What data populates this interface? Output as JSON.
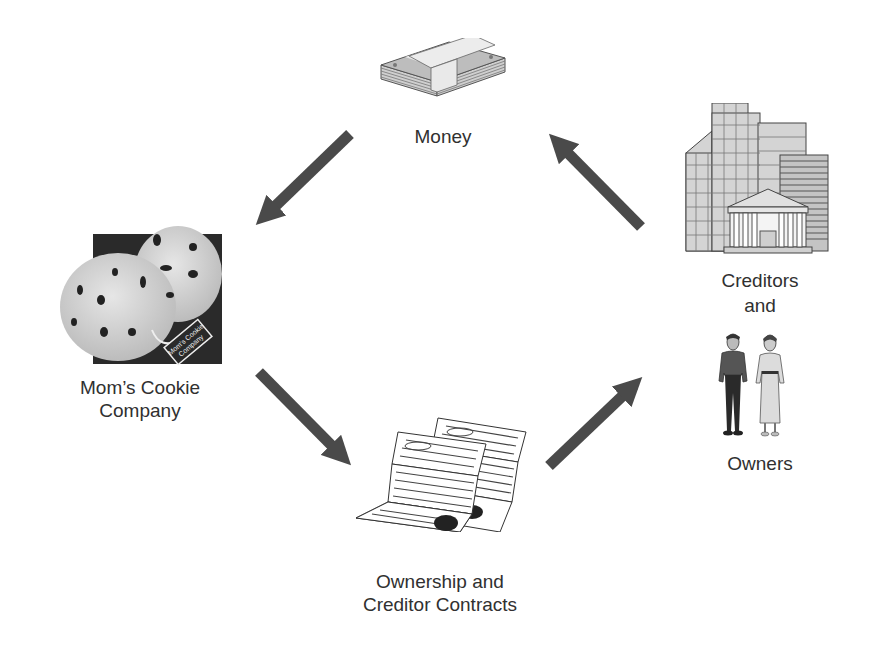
{
  "diagram": {
    "type": "cycle",
    "nodes": [
      {
        "id": "money",
        "label_lines": [
          "Money"
        ],
        "icon": "money-stack-icon"
      },
      {
        "id": "company",
        "label_lines": [
          "Mom’s Cookie",
          "Company"
        ],
        "icon": "cookies-icon",
        "package_text": [
          "Mom's Cookie",
          "Company"
        ]
      },
      {
        "id": "contracts",
        "label_lines": [
          "Ownership and",
          "Creditor Contracts"
        ],
        "icon": "contracts-icon"
      },
      {
        "id": "creditors_owners",
        "label_lines": [
          "Creditors",
          "and",
          "Owners"
        ],
        "icons": [
          "buildings-icon",
          "people-icon"
        ]
      }
    ],
    "edges": [
      {
        "from": "money",
        "to": "company"
      },
      {
        "from": "creditors_owners",
        "to": "money"
      },
      {
        "from": "company",
        "to": "contracts"
      },
      {
        "from": "contracts",
        "to": "creditors_owners"
      }
    ]
  },
  "labels": {
    "money": "Money",
    "company_line1": "Mom’s Cookie",
    "company_line2": "Company",
    "contracts_line1": "Ownership and",
    "contracts_line2": "Creditor Contracts",
    "creditors": "Creditors",
    "and": "and",
    "owners": "Owners",
    "package_line1": "Mom's Cookie",
    "package_line2": "Company"
  },
  "colors": {
    "arrow": "#4a4a4a",
    "text": "#303030",
    "background": "#ffffff"
  }
}
